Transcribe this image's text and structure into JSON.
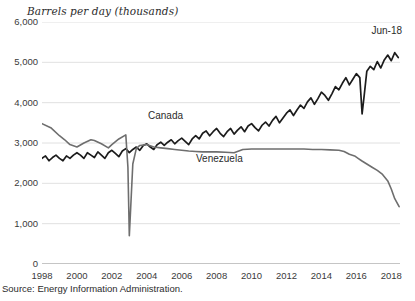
{
  "chart_data": {
    "type": "line",
    "title": "",
    "ylabel": "Barrels per day (thousands)",
    "xlabel": "",
    "ylim": [
      0,
      6000
    ],
    "ytick_values": [
      0,
      1000,
      2000,
      3000,
      4000,
      5000,
      6000
    ],
    "ytick_labels": [
      "0",
      "1,000",
      "2,000",
      "3,000",
      "4,000",
      "5,000",
      "6,000"
    ],
    "xlim": [
      1998,
      2018.5
    ],
    "xtick_values": [
      1998,
      2000,
      2002,
      2004,
      2006,
      2008,
      2010,
      2012,
      2014,
      2016,
      2018
    ],
    "xtick_labels": [
      "1998",
      "2000",
      "2002",
      "2004",
      "2006",
      "2008",
      "2010",
      "2012",
      "2014",
      "2016",
      "2018"
    ],
    "grid": "horizontal",
    "legend_position": "inline-annotations",
    "annotations": [
      {
        "text": "Jun-18",
        "x": 2018.4,
        "y": 5650
      },
      {
        "text": "Canada",
        "x": 2005.4,
        "y": 3700
      },
      {
        "text": "Venezuela",
        "x": 2008.2,
        "y": 2450
      }
    ],
    "series": [
      {
        "name": "Canada",
        "color": "#1c1c1c",
        "label_x": 2005.4,
        "label_y": 3700,
        "x": [
          1998.0,
          1998.2,
          1998.4,
          1998.6,
          1998.8,
          1999.0,
          1999.2,
          1999.4,
          1999.6,
          1999.8,
          2000.0,
          2000.2,
          2000.4,
          2000.6,
          2000.8,
          2001.0,
          2001.2,
          2001.4,
          2001.6,
          2001.8,
          2002.0,
          2002.2,
          2002.4,
          2002.6,
          2002.8,
          2003.0,
          2003.2,
          2003.4,
          2003.6,
          2003.8,
          2004.0,
          2004.2,
          2004.4,
          2004.6,
          2004.8,
          2005.0,
          2005.2,
          2005.4,
          2005.6,
          2005.8,
          2006.0,
          2006.2,
          2006.4,
          2006.6,
          2006.8,
          2007.0,
          2007.2,
          2007.4,
          2007.6,
          2007.8,
          2008.0,
          2008.2,
          2008.4,
          2008.6,
          2008.8,
          2009.0,
          2009.2,
          2009.4,
          2009.6,
          2009.8,
          2010.0,
          2010.2,
          2010.4,
          2010.6,
          2010.8,
          2011.0,
          2011.2,
          2011.4,
          2011.6,
          2011.8,
          2012.0,
          2012.2,
          2012.4,
          2012.6,
          2012.8,
          2013.0,
          2013.2,
          2013.4,
          2013.6,
          2013.8,
          2014.0,
          2014.2,
          2014.4,
          2014.6,
          2014.8,
          2015.0,
          2015.2,
          2015.4,
          2015.6,
          2015.8,
          2016.0,
          2016.2,
          2016.33,
          2016.45,
          2016.6,
          2016.8,
          2017.0,
          2017.2,
          2017.4,
          2017.6,
          2017.8,
          2018.0,
          2018.2,
          2018.4
        ],
        "y": [
          2620,
          2680,
          2560,
          2640,
          2700,
          2620,
          2560,
          2680,
          2620,
          2700,
          2760,
          2700,
          2620,
          2760,
          2700,
          2640,
          2780,
          2700,
          2620,
          2760,
          2820,
          2740,
          2660,
          2800,
          2860,
          2760,
          2840,
          2900,
          2820,
          2940,
          2980,
          2900,
          2840,
          2960,
          3020,
          2940,
          3020,
          3080,
          2980,
          3060,
          3120,
          3040,
          2960,
          3100,
          3180,
          3100,
          3240,
          3300,
          3180,
          3280,
          3360,
          3240,
          3160,
          3280,
          3360,
          3220,
          3320,
          3400,
          3280,
          3420,
          3480,
          3380,
          3300,
          3440,
          3520,
          3420,
          3560,
          3660,
          3500,
          3620,
          3740,
          3820,
          3680,
          3820,
          3940,
          3860,
          4020,
          4120,
          3960,
          4100,
          4260,
          4180,
          4060,
          4220,
          4400,
          4320,
          4480,
          4620,
          4440,
          4580,
          4720,
          4620,
          3720,
          4180,
          4780,
          4900,
          4820,
          5020,
          4860,
          5060,
          5180,
          5040,
          5240,
          5120
        ]
      },
      {
        "name": "Venezuela",
        "color": "#6e6e6e",
        "label_x": 2008.2,
        "label_y": 2450,
        "x": [
          1998.0,
          1998.5,
          1999.0,
          1999.3,
          1999.6,
          2000.0,
          2000.4,
          2000.8,
          2001.0,
          2001.4,
          2001.8,
          2002.0,
          2002.4,
          2002.8,
          2002.92,
          2003.0,
          2003.08,
          2003.2,
          2003.4,
          2003.6,
          2004.0,
          2004.4,
          2004.8,
          2005.2,
          2005.6,
          2006.0,
          2006.4,
          2006.8,
          2007.2,
          2007.6,
          2008.0,
          2008.5,
          2009.0,
          2009.5,
          2010.0,
          2010.5,
          2011.0,
          2011.5,
          2012.0,
          2012.5,
          2013.0,
          2013.5,
          2014.0,
          2014.5,
          2015.0,
          2015.3,
          2015.6,
          2015.9,
          2016.1,
          2016.3,
          2016.6,
          2016.9,
          2017.2,
          2017.5,
          2017.8,
          2018.0,
          2018.2,
          2018.45
        ],
        "y": [
          3480,
          3380,
          3180,
          3080,
          2960,
          2900,
          3000,
          3080,
          3060,
          2980,
          2880,
          2960,
          3100,
          3200,
          2400,
          700,
          1400,
          2480,
          2860,
          2940,
          2960,
          2900,
          2880,
          2860,
          2840,
          2820,
          2800,
          2790,
          2780,
          2780,
          2780,
          2770,
          2760,
          2840,
          2850,
          2850,
          2850,
          2850,
          2850,
          2850,
          2850,
          2840,
          2840,
          2830,
          2820,
          2790,
          2720,
          2680,
          2620,
          2560,
          2480,
          2400,
          2320,
          2220,
          2060,
          1860,
          1620,
          1420
        ]
      }
    ]
  },
  "source": {
    "text": "Source: Energy Information Administration."
  }
}
